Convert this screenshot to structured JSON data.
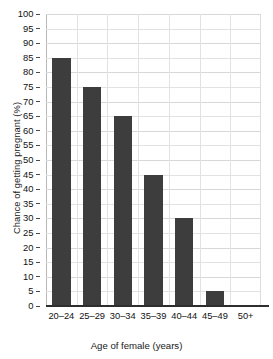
{
  "chart_data": {
    "type": "bar",
    "title": "",
    "categories": [
      "20–24",
      "25–29",
      "30–34",
      "35–39",
      "40–44",
      "45–49",
      "50+"
    ],
    "values": [
      85,
      75,
      65,
      45,
      30,
      5,
      0
    ],
    "xlabel": "Age of female (years)",
    "ylabel": "Chance of getting pregnant (%)",
    "ylim": [
      0,
      100
    ],
    "ytick_step": 5,
    "yticks": [
      0,
      5,
      10,
      15,
      20,
      25,
      30,
      35,
      40,
      45,
      50,
      55,
      60,
      65,
      70,
      75,
      80,
      85,
      90,
      95,
      100
    ],
    "ytick_labels": [
      "0",
      "5",
      "10",
      "15",
      "20",
      "25",
      "30",
      "35",
      "40",
      "45",
      "50",
      "55",
      "60",
      "65",
      "70",
      "75",
      "80",
      "85",
      "90",
      "95",
      "100"
    ],
    "grid": true,
    "grid_axis": "both",
    "legend": false,
    "legend_position": "none",
    "bar_color": "#3d3d3d",
    "grid_color": "#e2e2e2",
    "axis_color": "#2e2e2e",
    "background": "#ffffff",
    "bar_width_ratio": 0.6
  }
}
